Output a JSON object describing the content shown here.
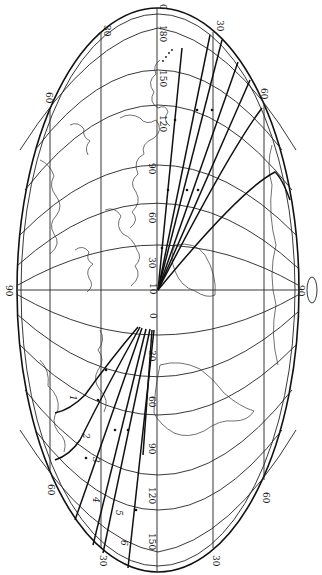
{
  "map": {
    "type": "elliptical world map projection, rotated 90 degrees, with great-circle trajectory routes",
    "colors": {
      "ink": "#111111",
      "paper": "#ffffff",
      "coast": "#333333"
    },
    "graticule_labels": {
      "top_pole": "0",
      "top_meridians": [
        "30",
        "180",
        "30"
      ],
      "top_arc_labels": [
        "150",
        "120",
        "90",
        "60",
        "30"
      ],
      "center": [
        "10",
        "0"
      ],
      "bottom_arc_labels": [
        "30",
        "60",
        "90",
        "120",
        "150"
      ],
      "left_edge": "90",
      "right_edge": "90",
      "upper_left_60": "60",
      "upper_right_60": "60",
      "lower_left_60": "60",
      "lower_right_60": "60",
      "bottom_left_30": "30",
      "bottom_right_30": "30"
    },
    "routes": [
      {
        "id": "1",
        "label": "1"
      },
      {
        "id": "2",
        "label": "2"
      },
      {
        "id": "3",
        "label": "3"
      },
      {
        "id": "4",
        "label": "4"
      },
      {
        "id": "5",
        "label": "5"
      },
      {
        "id": "6",
        "label": "6"
      }
    ],
    "symbols": {
      "orbit_icon": "orbit-ellipse-icon"
    }
  }
}
